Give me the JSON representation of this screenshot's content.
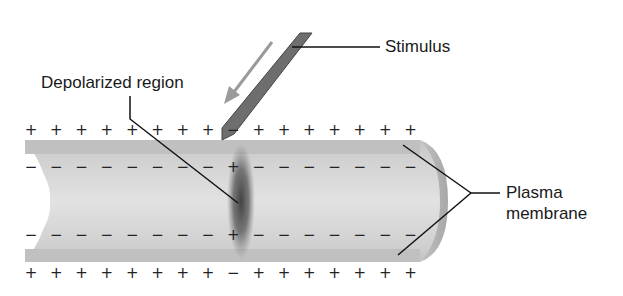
{
  "diagram": {
    "labels": {
      "stimulus": "Stimulus",
      "depolarized_region": "Depolarized region",
      "plasma_membrane_line1": "Plasma",
      "plasma_membrane_line2": "membrane"
    },
    "charges": {
      "outer_top": [
        "+",
        "+",
        "+",
        "+",
        "+",
        "+",
        "+",
        "+",
        "−",
        "+",
        "+",
        "+",
        "+",
        "+",
        "+",
        "+"
      ],
      "inner_top": [
        "−",
        "−",
        "−",
        "−",
        "−",
        "−",
        "−",
        "−",
        "+",
        "−",
        "−",
        "−",
        "−",
        "−",
        "−",
        "−"
      ],
      "inner_bottom": [
        "−",
        "−",
        "−",
        "−",
        "−",
        "−",
        "−",
        "−",
        "+",
        "−",
        "−",
        "−",
        "−",
        "−",
        "−",
        "−"
      ],
      "outer_bottom": [
        "+",
        "+",
        "+",
        "+",
        "+",
        "+",
        "+",
        "+",
        "−",
        "+",
        "+",
        "+",
        "+",
        "+",
        "+",
        "+"
      ]
    },
    "colors": {
      "membrane": "#c8c8c8",
      "membrane_inner": "#dcdcdc",
      "depolarized": "#505050",
      "probe": "#6e6e6e",
      "arrow": "#9a9a9a",
      "leader": "#111111"
    }
  }
}
